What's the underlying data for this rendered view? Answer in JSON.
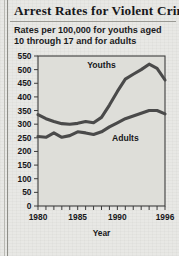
{
  "headline": "Arrest Rates for Violent Crime",
  "subtitle_line1": "Rates per 100,000 for youths aged",
  "subtitle_line2": "10 through 17 and for adults",
  "colors": {
    "paper": "#dcdcd7",
    "ink": "#17171a",
    "line": "#4a4a4a",
    "frame": "#3c3c3c",
    "plot_bg": "#dedeD9"
  },
  "chart_data": {
    "type": "line",
    "title": "Arrest Rates for Violent Crime",
    "subtitle": "Rates per 100,000 for youths aged 10 through 17 and for adults",
    "xlabel": "Year",
    "ylabel": "",
    "xlim": [
      1980,
      1996
    ],
    "ylim": [
      0,
      550
    ],
    "yticks": [
      0,
      50,
      100,
      150,
      200,
      250,
      300,
      350,
      400,
      450,
      500,
      550
    ],
    "xticks": [
      1980,
      1981,
      1982,
      1983,
      1984,
      1985,
      1986,
      1987,
      1988,
      1989,
      1990,
      1991,
      1992,
      1993,
      1994,
      1995,
      1996
    ],
    "xtick_labels_shown": [
      1980,
      1985,
      1990,
      1996
    ],
    "grid": false,
    "legend": "inline-annotations",
    "x": [
      1980,
      1981,
      1982,
      1983,
      1984,
      1985,
      1986,
      1987,
      1988,
      1989,
      1990,
      1991,
      1992,
      1993,
      1994,
      1995,
      1996
    ],
    "series": [
      {
        "name": "Youths",
        "label_x": 1988,
        "label_y": 505,
        "values": [
          335,
          320,
          310,
          302,
          300,
          303,
          310,
          305,
          325,
          370,
          420,
          465,
          483,
          500,
          520,
          505,
          462
        ]
      },
      {
        "name": "Adults",
        "label_x": 1991,
        "label_y": 238,
        "values": [
          255,
          252,
          268,
          252,
          258,
          272,
          268,
          262,
          272,
          290,
          305,
          320,
          330,
          340,
          350,
          350,
          338
        ]
      }
    ]
  },
  "axis": {
    "x_title": "Year",
    "ytick_labels": [
      "550",
      "500",
      "450",
      "400",
      "350",
      "300",
      "250",
      "200",
      "150",
      "100",
      "50",
      "0"
    ],
    "xtick_labels": [
      "1980",
      "1985",
      "1990",
      "1996"
    ]
  }
}
